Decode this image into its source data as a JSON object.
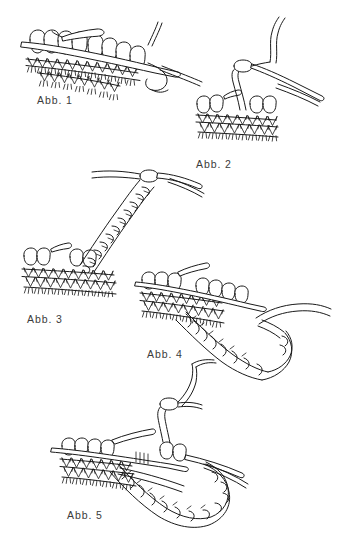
{
  "page": {
    "background_color": "#ffffff",
    "ink_color": "#1a1a1a",
    "label_color": "#3b3b3b",
    "width": 341,
    "height": 545
  },
  "figures": [
    {
      "id": "fig-1",
      "label": "Abb. 1",
      "caption_position": {
        "x": 37,
        "y": 94
      },
      "subject": "knitting-needle-with-stitches",
      "description": "Knitting needle holding a row of stitches over knitted fabric, working yarn trailing to the right"
    },
    {
      "id": "fig-2",
      "label": "Abb. 2",
      "caption_position": {
        "x": 196,
        "y": 158
      },
      "subject": "needle-with-yarn-loop",
      "description": "Needle tip drawing a loop of yarn up through the stitches at the right edge of the fabric"
    },
    {
      "id": "fig-3",
      "label": "Abb. 3",
      "caption_position": {
        "x": 27,
        "y": 313
      },
      "subject": "chain-cord-from-fabric",
      "description": "A braided chain cord worked upward and to the right away from the edge of the knitted fabric"
    },
    {
      "id": "fig-4",
      "label": "Abb. 4",
      "caption_position": {
        "x": 147,
        "y": 348
      },
      "subject": "chain-edging-along-fabric",
      "description": "Chain edging being worked downward along the side edge of the knitted fabric on the needle"
    },
    {
      "id": "fig-5",
      "label": "Abb. 5",
      "caption_position": {
        "x": 67,
        "y": 509
      },
      "subject": "completed-chain-loop",
      "description": "Finished chain loop hanging from the fabric with the needle re-inserted through the stitches"
    }
  ],
  "icons": {
    "figure_illustration": "knitting-diagram-icon"
  }
}
